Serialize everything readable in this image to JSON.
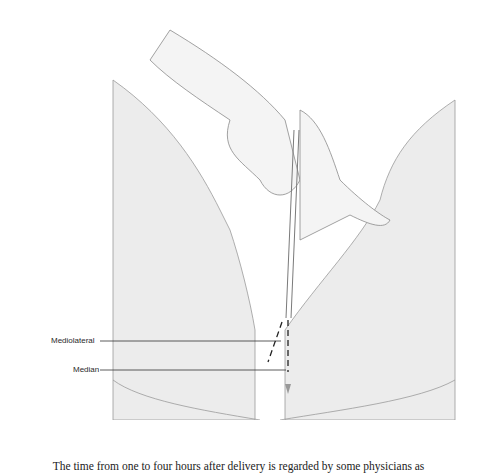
{
  "figure": {
    "labels": [
      {
        "id": "mediolateral",
        "text": "Mediolateral"
      },
      {
        "id": "median",
        "text": "Median"
      }
    ]
  },
  "body_text": {
    "line": "The time from one to four hours after delivery is regarded by some physicians as"
  }
}
